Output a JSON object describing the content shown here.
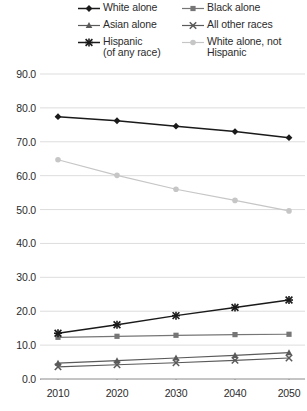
{
  "chart_data": {
    "type": "line",
    "title": "",
    "xlabel": "",
    "ylabel": "",
    "x": [
      2010,
      2020,
      2030,
      2040,
      2050
    ],
    "categories": [
      "2010",
      "2020",
      "2030",
      "2040",
      "2050"
    ],
    "xtick_labels": [
      "2010",
      "2020",
      "2030",
      "2040",
      "2050"
    ],
    "ytick_labels": [
      "90.0",
      "80.0",
      "70.0",
      "60.0",
      "50.0",
      "40.0",
      "30.0",
      "20.0",
      "10.0",
      "0.0"
    ],
    "ytick_values": [
      90.0,
      80.0,
      70.0,
      60.0,
      50.0,
      40.0,
      30.0,
      20.0,
      10.0,
      0.0
    ],
    "ylim": [
      0.0,
      90.0
    ],
    "grid": true,
    "legend_position": "top",
    "series": [
      {
        "name": "White alone",
        "marker": "diamond",
        "color": "#1a1a1a",
        "values": [
          77.4,
          76.2,
          74.6,
          73.0,
          71.2
        ]
      },
      {
        "name": "Black alone",
        "marker": "square",
        "color": "#767676",
        "values": [
          12.3,
          12.6,
          12.9,
          13.1,
          13.2
        ]
      },
      {
        "name": "Asian alone",
        "marker": "triangle",
        "color": "#5a5a5a",
        "values": [
          4.7,
          5.4,
          6.2,
          7.0,
          7.8
        ]
      },
      {
        "name": "All other races",
        "marker": "x",
        "color": "#5a5a5a",
        "values": [
          3.6,
          4.2,
          4.8,
          5.5,
          6.2
        ]
      },
      {
        "name": "Hispanic\n(of any race)",
        "marker": "star",
        "color": "#1a1a1a",
        "values": [
          13.5,
          16.0,
          18.7,
          21.1,
          23.3
        ]
      },
      {
        "name": "White alone, not\nHispanic",
        "marker": "dot",
        "color": "#c6c6c6",
        "values": [
          64.7,
          60.1,
          56.0,
          52.7,
          49.6
        ]
      }
    ]
  },
  "legend": {
    "items": [
      {
        "label": "White alone",
        "marker": "diamond",
        "color": "#1a1a1a"
      },
      {
        "label": "Black alone",
        "marker": "square",
        "color": "#767676"
      },
      {
        "label": "Asian alone",
        "marker": "triangle",
        "color": "#5a5a5a"
      },
      {
        "label": "All other races",
        "marker": "x",
        "color": "#5a5a5a"
      },
      {
        "label": "Hispanic\n(of any race)",
        "marker": "star",
        "color": "#1a1a1a"
      },
      {
        "label": "White alone, not\nHispanic",
        "marker": "dot",
        "color": "#c6c6c6"
      }
    ]
  },
  "axes": {
    "grid_color": "#d9d9d9",
    "axis_color": "#8a8a8a"
  }
}
